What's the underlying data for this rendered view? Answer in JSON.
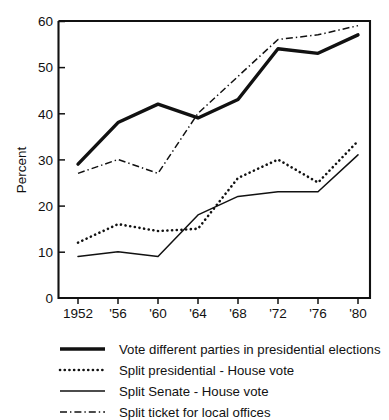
{
  "chart_data": {
    "type": "line",
    "title": "",
    "xlabel": "",
    "ylabel": "Percent",
    "ylim": [
      0,
      60
    ],
    "yticks": [
      0,
      10,
      20,
      30,
      40,
      50,
      60
    ],
    "ytick_labels": [
      "0",
      "10",
      "20",
      "30",
      "40",
      "50",
      "60"
    ],
    "grid": false,
    "legend_position": "bottom",
    "x": [
      1952,
      1956,
      1960,
      1964,
      1968,
      1972,
      1976,
      1980
    ],
    "categories": [
      "1952",
      "'56",
      "'60",
      "'64",
      "'68",
      "'72",
      "'76",
      "'80"
    ],
    "series": [
      {
        "name": "Vote different parties in presidential elections",
        "style": "thick-solid",
        "values": [
          29,
          38,
          42,
          39,
          43,
          54,
          53,
          57
        ]
      },
      {
        "name": "Split presidential - House vote",
        "style": "dotted",
        "values": [
          12,
          16,
          14.5,
          15,
          26,
          30,
          25,
          34
        ]
      },
      {
        "name": "Split Senate - House vote",
        "style": "thin-solid",
        "values": [
          9,
          10,
          9,
          18,
          22,
          23,
          23,
          31
        ]
      },
      {
        "name": "Split ticket for local offices",
        "style": "dash-dot",
        "values": [
          27,
          30,
          27,
          40,
          48,
          56,
          57,
          59
        ]
      }
    ]
  },
  "legend": {
    "items": [
      {
        "label": "Vote different parties in presidential elections",
        "style": "thick-solid"
      },
      {
        "label": "Split presidential - House vote",
        "style": "dotted"
      },
      {
        "label": "Split  Senate - House vote",
        "style": "thin-solid"
      },
      {
        "label": "Split ticket for local offices",
        "style": "dash-dot"
      }
    ]
  },
  "axis": {
    "y_label": "Percent",
    "y_tick_labels": [
      "60",
      "50",
      "40",
      "30",
      "20",
      "10",
      "0"
    ],
    "x_tick_labels": [
      "1952",
      "'56",
      "'60",
      "'64",
      "'68",
      "'72",
      "'76",
      "'80"
    ]
  }
}
